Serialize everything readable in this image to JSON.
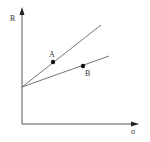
{
  "diagram": {
    "axes": {
      "y_label": "R",
      "x_label": "σ",
      "origin": [
        22,
        124
      ],
      "y_axis_top": 8,
      "x_axis_right": 139
    },
    "lines": [
      {
        "name": "upper-line",
        "from": [
          22,
          87
        ],
        "to": [
          101,
          25
        ]
      },
      {
        "name": "lower-line",
        "from": [
          22,
          87
        ],
        "to": [
          109,
          56
        ]
      }
    ],
    "points": [
      {
        "label": "A",
        "x": 53,
        "y": 62,
        "label_x": 49,
        "label_y": 57
      },
      {
        "label": "B",
        "x": 83,
        "y": 66,
        "label_x": 85,
        "label_y": 76
      }
    ],
    "colors": {
      "axis": "#555555",
      "line": "#666666",
      "point": "#111111",
      "text": "#333333"
    }
  }
}
